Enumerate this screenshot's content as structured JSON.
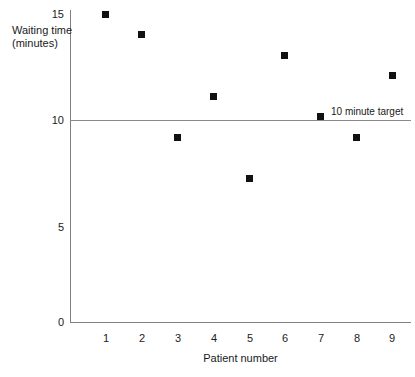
{
  "chart_data": {
    "type": "scatter",
    "title": "",
    "xlabel": "Patient number",
    "ylabel": "Waiting time (minutes)",
    "ylabel_lines": [
      "Waiting time",
      "(minutes)"
    ],
    "x": [
      1,
      2,
      3,
      4,
      5,
      6,
      7,
      8,
      9
    ],
    "values": [
      15,
      14,
      9,
      11,
      7,
      13,
      10,
      9,
      12
    ],
    "series": [
      {
        "name": "Waiting time",
        "values": [
          15,
          14,
          9,
          11,
          7,
          13,
          10,
          9,
          12
        ]
      }
    ],
    "xlim": [
      0.4,
      9.6
    ],
    "ylim": [
      0,
      15
    ],
    "xticks": [
      "1",
      "2",
      "3",
      "4",
      "5",
      "6",
      "7",
      "8",
      "9"
    ],
    "yticks": [
      "0",
      "5",
      "10",
      "15"
    ],
    "ytick_values": [
      0,
      5,
      10,
      15
    ],
    "grid": false,
    "legend": false,
    "marker": "square",
    "marker_color": "#111111",
    "annotations": [
      {
        "name": "target-line",
        "label": "10 minute target",
        "y": 10,
        "type": "horizontal-reference-line",
        "color": "#8a8a8a"
      }
    ]
  },
  "axes": {
    "x_title": "Patient number",
    "y_title_line1": "Waiting time",
    "y_title_line2": "(minutes)",
    "y_ticks": [
      {
        "label": "15",
        "value": 15
      },
      {
        "label": "10",
        "value": 10
      },
      {
        "label": "5",
        "value": 5
      },
      {
        "label": "0",
        "value": 0
      }
    ],
    "x_ticks": [
      {
        "label": "1"
      },
      {
        "label": "2"
      },
      {
        "label": "3"
      },
      {
        "label": "4"
      },
      {
        "label": "5"
      },
      {
        "label": "6"
      },
      {
        "label": "7"
      },
      {
        "label": "8"
      },
      {
        "label": "9"
      }
    ]
  },
  "target": {
    "label": "10 minute target"
  },
  "colors": {
    "background": "#ffffff",
    "axis": "#808080",
    "marker": "#111111",
    "target_line": "#8a8a8a",
    "text": "#1a1a1a"
  }
}
